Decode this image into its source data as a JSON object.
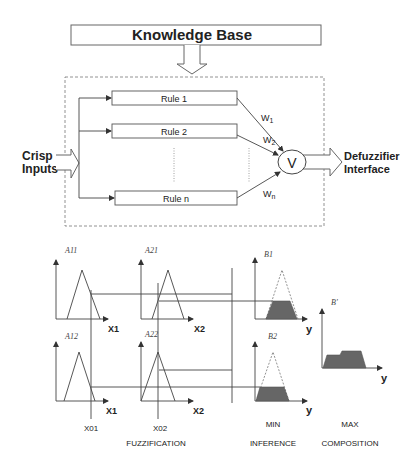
{
  "top": {
    "knowledge_base": "Knowledge Base",
    "crisp_inputs_line1": "Crisp",
    "crisp_inputs_line2": "Inputs",
    "rules": [
      "Rule 1",
      "Rule 2",
      "Rule n"
    ],
    "weights": [
      {
        "base": "W",
        "sub": "1"
      },
      {
        "base": "W",
        "sub": "2"
      },
      {
        "base": "W",
        "sub": "n"
      }
    ],
    "aggregator_symbol": "V",
    "output_line1": "Defuzzifier",
    "output_line2": "Interface"
  },
  "bottom": {
    "sets": {
      "a11": "A11",
      "a21": "A21",
      "a12": "A12",
      "a22": "A22",
      "b1": "B1",
      "b2": "B2",
      "b_prime": "B'"
    },
    "axes": {
      "x1": "X1",
      "x2": "X2",
      "y": "y"
    },
    "inputs": {
      "x01": "X01",
      "x02": "X02"
    },
    "stages": {
      "fuzzification": "FUZZIFICATION",
      "min": "MIN",
      "inference": "INFERENCE",
      "max": "MAX",
      "composition": "COMPOSITION"
    }
  },
  "colors": {
    "stroke": "#444444",
    "fill": "#666666",
    "dashed": "#777777"
  }
}
